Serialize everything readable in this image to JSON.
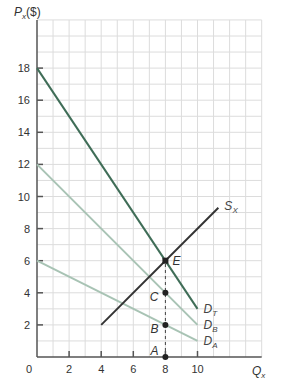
{
  "chart_data": {
    "type": "line",
    "title": "",
    "xlabel": "Q",
    "xlabel_sub": "x",
    "ylabel": "P",
    "ylabel_sub": "x",
    "ylabel_suffix": "($)",
    "xlim": [
      0,
      14
    ],
    "ylim": [
      0,
      21
    ],
    "grid": true,
    "x_ticks": [
      0,
      2,
      4,
      6,
      8,
      10
    ],
    "x_tick_labels": [
      "0",
      "2",
      "4",
      "6",
      "8",
      "10"
    ],
    "y_ticks": [
      2,
      4,
      6,
      8,
      10,
      12,
      14,
      16,
      18
    ],
    "y_tick_labels": [
      "2",
      "4",
      "6",
      "8",
      "10",
      "12",
      "14",
      "16",
      "18"
    ],
    "series": [
      {
        "name": "D_T",
        "label": "D",
        "label_sub": "T",
        "color": "#3f6d57",
        "points": [
          [
            0,
            18
          ],
          [
            10,
            3
          ]
        ]
      },
      {
        "name": "D_B",
        "label": "D",
        "label_sub": "B",
        "color": "#a8c3b4",
        "points": [
          [
            0,
            12
          ],
          [
            10,
            2
          ]
        ]
      },
      {
        "name": "D_A",
        "label": "D",
        "label_sub": "A",
        "color": "#a8c3b4",
        "points": [
          [
            0,
            6
          ],
          [
            10,
            1
          ]
        ]
      },
      {
        "name": "S_X",
        "label": "S",
        "label_sub": "X",
        "color": "#333333",
        "points": [
          [
            4,
            2
          ],
          [
            11.3,
            9.3
          ]
        ]
      }
    ],
    "points": [
      {
        "label": "A",
        "x": 8,
        "y": 0
      },
      {
        "label": "B",
        "x": 8,
        "y": 2
      },
      {
        "label": "C",
        "x": 8,
        "y": 4
      },
      {
        "label": "E",
        "x": 8,
        "y": 6
      }
    ],
    "dashed_guide": {
      "x": 8,
      "from_y": 0,
      "to_y": 6
    },
    "colors": {
      "grid": "#dcdcdc",
      "axis": "#555555",
      "guide": "#444444",
      "point": "#222222"
    }
  }
}
